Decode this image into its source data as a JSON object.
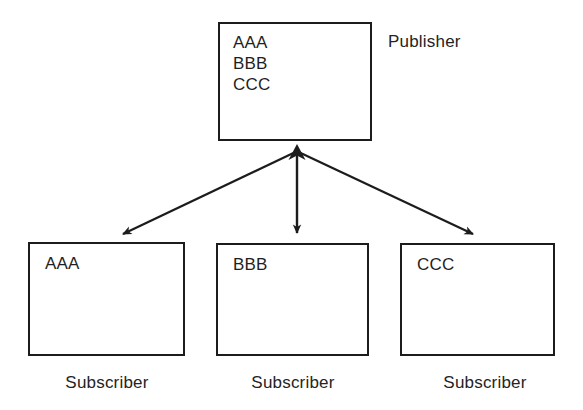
{
  "diagram": {
    "title_implied": "Publisher / Subscriber topic distribution",
    "background_color": "#ffffff",
    "stroke_color": "#1c1c1c",
    "text_color": "#1f1f1f",
    "publisher": {
      "caption": "Publisher",
      "topics": [
        {
          "label": "AAA"
        },
        {
          "label": "BBB"
        },
        {
          "label": "CCC"
        }
      ]
    },
    "subscribers": [
      {
        "topic": "AAA",
        "caption": "Subscriber"
      },
      {
        "topic": "BBB",
        "caption": "Subscriber"
      },
      {
        "topic": "CCC",
        "caption": "Subscriber"
      }
    ],
    "connectors": [
      {
        "name": "publisher-to-subscriber-1",
        "from": "publisher",
        "to": "subscriber-1",
        "direction": "down-left",
        "arrowheads": "both"
      },
      {
        "name": "publisher-to-subscriber-2",
        "from": "publisher",
        "to": "subscriber-2",
        "direction": "down",
        "arrowheads": "both"
      },
      {
        "name": "publisher-to-subscriber-3",
        "from": "publisher",
        "to": "subscriber-3",
        "direction": "down-right",
        "arrowheads": "both"
      }
    ]
  }
}
